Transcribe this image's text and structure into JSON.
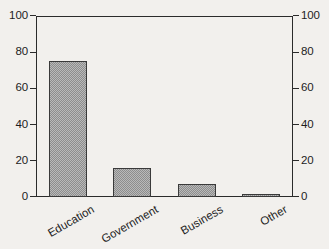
{
  "chart_data": {
    "type": "bar",
    "title": "",
    "subtitle": "",
    "xlabel": "",
    "ylabel": "",
    "categories": [
      "Education",
      "Government",
      "Business",
      "Other"
    ],
    "values": [
      75,
      16,
      7,
      1
    ],
    "series": [
      {
        "name": "Percent",
        "values": [
          75,
          16,
          7,
          1
        ]
      }
    ],
    "ylim": [
      0,
      100
    ],
    "y_ticks": [
      0,
      20,
      40,
      60,
      80,
      100
    ],
    "y_tick_labels": [
      "0",
      "20",
      "40",
      "60",
      "80",
      "100"
    ],
    "right_axis": {
      "present": true,
      "ylim": [
        0,
        100
      ],
      "y_ticks": [
        0,
        20,
        40,
        60,
        80,
        100
      ],
      "y_tick_labels": [
        "0",
        "20",
        "40",
        "60",
        "80",
        "100"
      ]
    },
    "grid": false,
    "legend": false,
    "legend_position": "none",
    "bar_fill": "#b9b9b9",
    "bar_pattern": "checkerboard-dither",
    "bar_edge_color": "#3a3a3a",
    "axis_color": "#2b2b2b",
    "background_color": "#f2f0ed",
    "text_color": "#1d1d1d",
    "xtick_rotation_degrees": -30,
    "annotations": []
  },
  "axis": {
    "left_ticks": [
      {
        "label": "100",
        "value": 100
      },
      {
        "label": "80",
        "value": 80
      },
      {
        "label": "60",
        "value": 60
      },
      {
        "label": "40",
        "value": 40
      },
      {
        "label": "20",
        "value": 20
      },
      {
        "label": "0",
        "value": 0
      }
    ],
    "right_ticks": [
      {
        "label": "100",
        "value": 100
      },
      {
        "label": "80",
        "value": 80
      },
      {
        "label": "60",
        "value": 60
      },
      {
        "label": "40",
        "value": 40
      },
      {
        "label": "20",
        "value": 20
      },
      {
        "label": "0",
        "value": 0
      }
    ]
  },
  "bars": [
    {
      "label": "Education",
      "value": 75
    },
    {
      "label": "Government",
      "value": 16
    },
    {
      "label": "Business",
      "value": 7
    },
    {
      "label": "Other",
      "value": 1
    }
  ]
}
